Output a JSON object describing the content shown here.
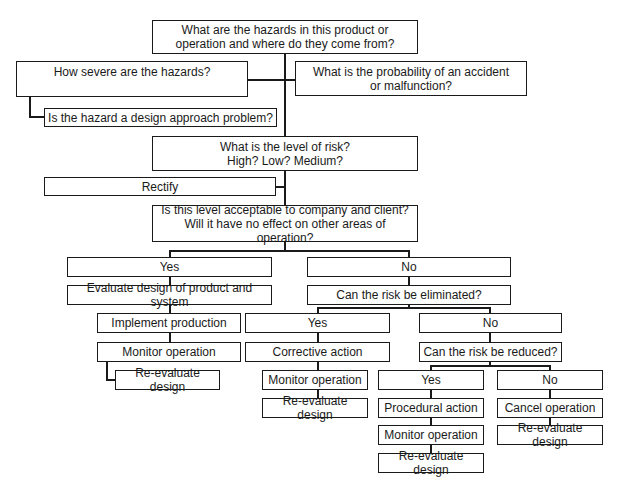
{
  "diagram": {
    "type": "flowchart",
    "title_question": {
      "line1": "What are the hazards in this product or",
      "line2": "operation and where do they come from?"
    },
    "severity": "How severe are the hazards?",
    "design_approach": "Is the hazard a design approach problem?",
    "probability": {
      "line1": "What is the probability of an accident",
      "line2": "or malfunction?"
    },
    "risk_level": {
      "line1": "What is the level of risk?",
      "line2": "High? Low? Medium?"
    },
    "rectify": "Rectify",
    "acceptable": {
      "line1": "Is this level acceptable to company and client?",
      "line2": "Will it have no effect on other areas of operation?"
    },
    "acceptable_yes": {
      "label": "Yes",
      "evaluate": "Evaluate design of product and system",
      "implement": "Implement production",
      "monitor": "Monitor operation",
      "reevaluate": "Re-evaluate design"
    },
    "acceptable_no": {
      "label": "No",
      "question": "Can the risk be eliminated?",
      "eliminate_yes": {
        "label": "Yes",
        "action": "Corrective action",
        "monitor": "Monitor operation",
        "reevaluate": "Re-evaluate design"
      },
      "eliminate_no": {
        "label": "No",
        "question": "Can the risk be reduced?",
        "reduce_yes": {
          "label": "Yes",
          "action": "Procedural action",
          "monitor": "Monitor operation",
          "reevaluate": "Re-evaluate design"
        },
        "reduce_no": {
          "label": "No",
          "action": "Cancel operation",
          "reevaluate": "Re-evaluate design"
        }
      }
    }
  }
}
